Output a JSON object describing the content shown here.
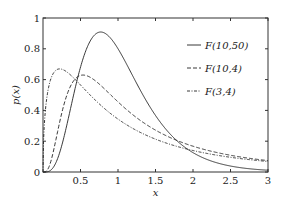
{
  "chart_data": {
    "type": "line",
    "title": "",
    "xlabel": "x",
    "ylabel": "p(x)",
    "xlim": [
      0,
      3
    ],
    "ylim": [
      0,
      1
    ],
    "xticks": [
      0.5,
      1,
      1.5,
      2,
      2.5,
      3
    ],
    "xtick_labels": [
      "0.5",
      "1",
      "1.5",
      "2",
      "2.5",
      "3"
    ],
    "yticks": [
      0,
      0.2,
      0.4,
      0.6,
      0.8,
      1
    ],
    "ytick_labels": [
      "0",
      "0.2",
      "0.4",
      "0.6",
      "0.8",
      "1"
    ],
    "grid": false,
    "legend_position": "top-right",
    "series": [
      {
        "name": "F(10,50)",
        "distribution": "F",
        "d1": 10,
        "d2": 50,
        "line_style": "solid",
        "color": "#222222",
        "x": [
          0.25,
          0.5,
          0.75,
          1.0,
          1.5,
          2.0,
          2.5,
          3.0
        ],
        "values": [
          0.09,
          0.55,
          0.91,
          0.78,
          0.34,
          0.1,
          0.03,
          0.01
        ]
      },
      {
        "name": "F(10,4)",
        "distribution": "F",
        "d1": 10,
        "d2": 4,
        "line_style": "dashed",
        "color": "#222222",
        "x": [
          0.25,
          0.5,
          0.75,
          1.0,
          1.5,
          2.0,
          2.5,
          3.0
        ],
        "values": [
          0.34,
          0.63,
          0.58,
          0.47,
          0.3,
          0.19,
          0.13,
          0.09
        ]
      },
      {
        "name": "F(3,4)",
        "distribution": "F",
        "d1": 3,
        "d2": 4,
        "line_style": "dash-dot",
        "color": "#222222",
        "x": [
          0.25,
          0.5,
          0.75,
          1.0,
          1.5,
          2.0,
          2.5,
          3.0
        ],
        "values": [
          0.66,
          0.58,
          0.47,
          0.38,
          0.25,
          0.17,
          0.12,
          0.09
        ]
      }
    ]
  }
}
